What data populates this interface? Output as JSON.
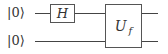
{
  "diagram": {
    "type": "quantum-circuit",
    "qubits": [
      {
        "label": "|0⟩"
      },
      {
        "label": "|0⟩"
      }
    ],
    "gates": [
      {
        "name": "H",
        "qubits": [
          0
        ]
      },
      {
        "name": "U",
        "subscript": "f",
        "qubits": [
          0,
          1
        ]
      }
    ],
    "colors": {
      "wire": "#444444",
      "gate_border": "#555555",
      "text": "#333333"
    }
  }
}
